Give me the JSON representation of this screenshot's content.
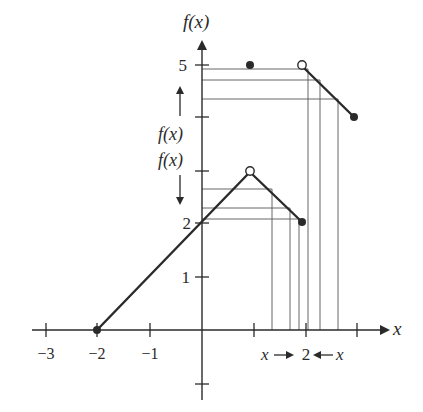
{
  "figure": {
    "axis_labels": {
      "x": "x",
      "y": "f(x)"
    },
    "x_ticks": [
      {
        "value": -3,
        "label": "−3"
      },
      {
        "value": -2,
        "label": "−2"
      },
      {
        "value": -1,
        "label": "−1"
      },
      {
        "value": 1,
        "label": ""
      },
      {
        "value": 2,
        "label": "2"
      },
      {
        "value": 3,
        "label": ""
      }
    ],
    "y_ticks": [
      {
        "value": 1,
        "label": "1"
      },
      {
        "value": 2,
        "label": "2"
      },
      {
        "value": 3,
        "label": ""
      },
      {
        "value": 4,
        "label": ""
      },
      {
        "value": 5,
        "label": "5"
      },
      {
        "value": -1,
        "label": ""
      }
    ],
    "annotations": {
      "upper_fx": "f(x)",
      "lower_fx": "f(x)",
      "x_left": "x",
      "x_center": "2",
      "x_right": "x"
    },
    "segments": [
      {
        "from": [
          -2,
          0
        ],
        "to": [
          1,
          3
        ]
      },
      {
        "from": [
          1,
          3
        ],
        "to": [
          2,
          2
        ]
      },
      {
        "from": [
          2,
          5
        ],
        "to": [
          3,
          4
        ]
      }
    ],
    "points": [
      {
        "x": -2,
        "y": 0,
        "type": "filled"
      },
      {
        "x": 1,
        "y": 5,
        "type": "filled"
      },
      {
        "x": 2,
        "y": 5,
        "type": "open"
      },
      {
        "x": 1,
        "y": 3,
        "type": "open"
      },
      {
        "x": 2,
        "y": 2,
        "type": "filled"
      },
      {
        "x": 3,
        "y": 4,
        "type": "filled"
      }
    ],
    "colors": {
      "ink": "#2a2a2a",
      "guide": "#555555"
    }
  }
}
